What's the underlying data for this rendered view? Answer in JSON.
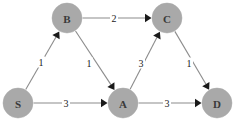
{
  "diagram": {
    "type": "directed-weighted-graph",
    "title": "",
    "background_color": "#ffffff",
    "node_fill_color": "#a9a9a9",
    "node_label_color": "#3a3a3a",
    "edge_color": "#8c8c8c",
    "arrowhead_color": "#1a1a1a",
    "weight_label_color": "#1a1a1a",
    "nodes": [
      {
        "id": "S",
        "label": "S",
        "x": 18,
        "y": 103,
        "r": 15
      },
      {
        "id": "B",
        "label": "B",
        "x": 67,
        "y": 18,
        "r": 15
      },
      {
        "id": "A",
        "label": "A",
        "x": 123,
        "y": 103,
        "r": 15
      },
      {
        "id": "C",
        "label": "C",
        "x": 167,
        "y": 18,
        "r": 15
      },
      {
        "id": "D",
        "label": "D",
        "x": 217,
        "y": 103,
        "r": 15
      }
    ],
    "edges": [
      {
        "id": "S-B",
        "from": "S",
        "to": "B",
        "weight": "1",
        "label_x": 41,
        "label_y": 62
      },
      {
        "id": "S-A",
        "from": "S",
        "to": "A",
        "weight": "3",
        "label_x": 66,
        "label_y": 103
      },
      {
        "id": "B-C",
        "from": "B",
        "to": "C",
        "weight": "2",
        "label_x": 114,
        "label_y": 18
      },
      {
        "id": "B-A",
        "from": "B",
        "to": "A",
        "weight": "1",
        "label_x": 89,
        "label_y": 63
      },
      {
        "id": "A-C",
        "from": "A",
        "to": "C",
        "weight": "3",
        "label_x": 141,
        "label_y": 63
      },
      {
        "id": "A-D",
        "from": "A",
        "to": "D",
        "weight": "3",
        "label_x": 167,
        "label_y": 103
      },
      {
        "id": "C-D",
        "from": "C",
        "to": "D",
        "weight": "1",
        "label_x": 189,
        "label_y": 63
      }
    ]
  }
}
